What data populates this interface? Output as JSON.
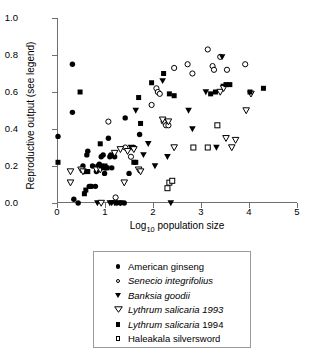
{
  "chart_data": {
    "type": "scatter",
    "title": "",
    "xlabel": "Log10 population size",
    "xlabel_base": "Log",
    "xlabel_sub": "10",
    "xlabel_rest": " population size",
    "ylabel": "Reproductive output (see legend)",
    "xlim": [
      0,
      5
    ],
    "ylim": [
      0,
      1.0
    ],
    "xticks": [
      0,
      1,
      2,
      3,
      4,
      5
    ],
    "xticklabels": [
      "0",
      "1",
      "2",
      "3",
      "4",
      "5"
    ],
    "yticks": [
      0.0,
      0.2,
      0.4,
      0.6,
      0.8,
      1.0
    ],
    "yticklabels": [
      "0.0",
      "0.2",
      "0.4",
      "0.6",
      "0.8",
      "1.0"
    ],
    "grid": false,
    "legend_position": "below-plot",
    "series": [
      {
        "name": "American ginseng",
        "marker": "filled-circle",
        "italic": false,
        "color": "#000000",
        "points": [
          [
            0.0,
            0.36
          ],
          [
            0.3,
            0.75
          ],
          [
            0.3,
            0.49
          ],
          [
            0.33,
            0.02
          ],
          [
            0.42,
            0.0
          ],
          [
            0.52,
            0.2
          ],
          [
            0.55,
            0.17
          ],
          [
            0.6,
            0.26
          ],
          [
            0.62,
            0.28
          ],
          [
            0.65,
            0.09
          ],
          [
            0.68,
            0.09
          ],
          [
            0.7,
            0.09
          ],
          [
            0.72,
            0.2
          ],
          [
            0.78,
            0.09
          ],
          [
            0.8,
            0.17
          ],
          [
            0.83,
            0.2
          ],
          [
            0.86,
            0.21
          ],
          [
            0.9,
            0.25
          ],
          [
            0.94,
            0.26
          ],
          [
            0.97,
            0.16
          ],
          [
            1.0,
            0.19
          ],
          [
            1.05,
            0.35
          ],
          [
            1.08,
            0.25
          ],
          [
            1.1,
            0.26
          ],
          [
            1.12,
            0.19
          ],
          [
            1.18,
            0.25
          ],
          [
            1.22,
            0.0
          ],
          [
            1.3,
            0.0
          ],
          [
            1.38,
            0.0
          ],
          [
            1.4,
            0.46
          ],
          [
            1.48,
            0.16
          ],
          [
            1.58,
            0.3
          ],
          [
            1.7,
            0.37
          ]
        ]
      },
      {
        "name": "Senecio integrifolius",
        "marker": "open-circle",
        "italic": true,
        "color": "#000000",
        "points": [
          [
            1.05,
            0.44
          ],
          [
            1.2,
            0.03
          ],
          [
            1.4,
            0.3
          ],
          [
            1.52,
            0.25
          ],
          [
            1.95,
            0.53
          ],
          [
            2.05,
            0.62
          ],
          [
            2.08,
            0.6
          ],
          [
            2.12,
            0.59
          ],
          [
            2.2,
            0.44
          ],
          [
            2.25,
            0.42
          ],
          [
            2.3,
            0.42
          ],
          [
            2.42,
            0.73
          ],
          [
            2.7,
            0.75
          ],
          [
            2.8,
            0.7
          ],
          [
            3.12,
            0.83
          ],
          [
            3.22,
            0.74
          ],
          [
            3.25,
            0.72
          ],
          [
            3.38,
            0.79
          ],
          [
            3.52,
            0.72
          ],
          [
            3.9,
            0.75
          ]
        ]
      },
      {
        "name": "Banksia goodii",
        "marker": "filled-triangle-down",
        "italic": true,
        "color": "#000000",
        "points": [
          [
            0.82,
            0.0
          ],
          [
            1.08,
            0.0
          ],
          [
            1.12,
            0.0
          ],
          [
            1.18,
            0.0
          ],
          [
            1.3,
            0.0
          ],
          [
            1.52,
            0.3
          ],
          [
            1.62,
            0.5
          ],
          [
            1.78,
            0.26
          ],
          [
            1.88,
            0.32
          ],
          [
            2.02,
            0.2
          ],
          [
            2.18,
            0.66
          ],
          [
            2.28,
            0.25
          ],
          [
            2.35,
            0.0
          ],
          [
            2.72,
            0.5
          ],
          [
            2.8,
            0.4
          ],
          [
            3.08,
            0.6
          ],
          [
            3.3,
            0.3
          ],
          [
            3.42,
            0.79
          ],
          [
            3.45,
            0.63
          ]
        ]
      },
      {
        "name": "Lythrum salicaria 1993",
        "marker": "open-triangle-down",
        "italic": true,
        "color": "#000000",
        "points": [
          [
            0.26,
            0.17
          ],
          [
            0.26,
            0.11
          ],
          [
            0.48,
            0.18
          ],
          [
            0.52,
            0.17
          ],
          [
            0.8,
            0.18
          ],
          [
            0.88,
            0.18
          ],
          [
            0.9,
            0.0
          ],
          [
            1.18,
            0.27
          ],
          [
            1.3,
            0.29
          ],
          [
            1.38,
            0.11
          ],
          [
            1.45,
            0.28
          ],
          [
            1.58,
            0.29
          ],
          [
            1.68,
            0.18
          ],
          [
            1.72,
            0.17
          ],
          [
            2.18,
            0.45
          ],
          [
            2.3,
            0.44
          ],
          [
            2.42,
            0.3
          ],
          [
            3.38,
            0.6
          ],
          [
            3.45,
            0.62
          ],
          [
            3.5,
            0.35
          ],
          [
            3.62,
            0.3
          ],
          [
            3.7,
            0.34
          ],
          [
            3.92,
            0.5
          ],
          [
            4.02,
            0.59
          ]
        ]
      },
      {
        "name": "Lythrum salicaria 1994",
        "marker": "filled-square",
        "italic": true,
        "italic_suffix": "1994",
        "color": "#000000",
        "points": [
          [
            0.0,
            0.22
          ],
          [
            0.46,
            0.6
          ],
          [
            0.55,
            0.05
          ],
          [
            0.58,
            0.07
          ],
          [
            0.6,
            0.17
          ],
          [
            0.62,
            0.17
          ],
          [
            0.88,
            0.32
          ],
          [
            0.9,
            0.2
          ],
          [
            0.95,
            0.19
          ],
          [
            0.98,
            0.2
          ],
          [
            1.02,
            0.19
          ],
          [
            1.58,
            0.22
          ],
          [
            1.62,
            0.22
          ],
          [
            1.68,
            0.57
          ],
          [
            1.72,
            0.43
          ],
          [
            1.95,
            0.65
          ],
          [
            2.2,
            0.7
          ],
          [
            2.32,
            0.59
          ],
          [
            2.42,
            0.58
          ],
          [
            3.18,
            0.59
          ],
          [
            3.28,
            0.6
          ],
          [
            3.5,
            0.64
          ],
          [
            3.58,
            0.64
          ],
          [
            4.0,
            0.6
          ],
          [
            4.28,
            0.62
          ]
        ]
      },
      {
        "name": "Haleakala silversword",
        "marker": "open-square",
        "italic": false,
        "color": "#000000",
        "points": [
          [
            2.28,
            0.08
          ],
          [
            2.32,
            0.11
          ],
          [
            2.38,
            0.12
          ],
          [
            2.82,
            0.3
          ],
          [
            3.12,
            0.3
          ],
          [
            3.32,
            0.42
          ]
        ]
      }
    ]
  },
  "legend": {
    "items": [
      {
        "label": "American ginseng",
        "marker": "filled-circle",
        "italic": false
      },
      {
        "label": "Senecio integrifolius",
        "marker": "open-circle",
        "italic": true
      },
      {
        "label": "Banksia goodii",
        "marker": "filled-triangle-down",
        "italic": true
      },
      {
        "label": "Lythrum salicaria 1993",
        "marker": "open-triangle-down",
        "italic": true
      },
      {
        "label": "Lythrum salicaria 1994",
        "marker": "filled-square",
        "italic": true
      },
      {
        "label": "Haleakala silversword",
        "marker": "open-square",
        "italic": false
      }
    ]
  },
  "axes": {
    "ylabel": "Reproductive output (see legend)",
    "xlabel_base": "Log",
    "xlabel_sub": "10",
    "xlabel_rest": " population size"
  }
}
